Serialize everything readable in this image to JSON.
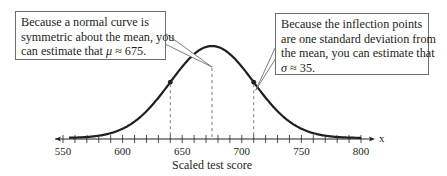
{
  "chart_data": {
    "type": "line",
    "title": "",
    "xlabel": "Scaled test score",
    "axis_variable": "x",
    "ylabel": "",
    "xlim": [
      545,
      810
    ],
    "x_ticks_major": [
      550,
      600,
      650,
      700,
      750,
      800
    ],
    "x_tick_labels": [
      "550",
      "600",
      "650",
      "700",
      "750",
      "800"
    ],
    "x_minor_tick_step": 10,
    "grid": false,
    "series": [
      {
        "name": "Normal curve",
        "distribution": "normal",
        "mean": 675,
        "std_dev": 35,
        "domain": [
          555,
          800
        ]
      }
    ],
    "marked_points": [
      {
        "name": "inflection-left",
        "x": 640
      },
      {
        "name": "inflection-right",
        "x": 710
      }
    ],
    "reference_lines": [
      {
        "name": "mean-line",
        "x": 675,
        "style": "dashed"
      },
      {
        "name": "minus-one-sd-line",
        "x": 640,
        "style": "dashed"
      },
      {
        "name": "plus-one-sd-line",
        "x": 710,
        "style": "dashed"
      }
    ],
    "annotations": [
      {
        "name": "mean-callout",
        "lines": [
          "Because a normal curve is",
          "symmetric about the mean, you",
          "can estimate that "
        ],
        "symbol": "μ",
        "estimate": "≈ 675.",
        "points_to_x": 675
      },
      {
        "name": "sd-callout",
        "lines": [
          "Because the inflection points",
          "are one standard deviation from",
          "the mean, you can estimate that"
        ],
        "symbol": "σ",
        "estimate": "≈ 35.",
        "points_to_x": 710
      }
    ]
  },
  "colors": {
    "curve": "#231f20",
    "axis": "#231f20",
    "dashed": "#58595b",
    "callout_border": "#6d6e71"
  }
}
